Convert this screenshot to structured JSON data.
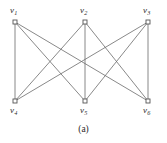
{
  "figure": {
    "caption": "(a)",
    "background_color": "#ffffff",
    "edge_color": "#6b6b6b",
    "vertex_stroke_color": "#555555",
    "vertex_fill_color": "#ffffff",
    "label_color": "#2b2b2b"
  },
  "chart_data": {
    "type": "diagram",
    "diagram_type": "graph",
    "title": "(a)",
    "graph_name": "K3,3 complete bipartite graph",
    "vertices": [
      {
        "id": "v1",
        "label": "v",
        "subscript": "1",
        "x": 15,
        "y": 22,
        "part": "top",
        "label_x": 10,
        "label_y": 6
      },
      {
        "id": "v2",
        "label": "v",
        "subscript": "2",
        "x": 85,
        "y": 22,
        "part": "top",
        "label_x": 80,
        "label_y": 6
      },
      {
        "id": "v3",
        "label": "v",
        "subscript": "3",
        "x": 148,
        "y": 22,
        "part": "top",
        "label_x": 143,
        "label_y": 6
      },
      {
        "id": "v4",
        "label": "v",
        "subscript": "4",
        "x": 15,
        "y": 101,
        "part": "bottom",
        "label_x": 10,
        "label_y": 106
      },
      {
        "id": "v5",
        "label": "v",
        "subscript": "5",
        "x": 85,
        "y": 101,
        "part": "bottom",
        "label_x": 80,
        "label_y": 106
      },
      {
        "id": "v6",
        "label": "v",
        "subscript": "6",
        "x": 148,
        "y": 101,
        "part": "bottom",
        "label_x": 143,
        "label_y": 106
      }
    ],
    "edges": [
      {
        "from": "v1",
        "to": "v4"
      },
      {
        "from": "v1",
        "to": "v5"
      },
      {
        "from": "v1",
        "to": "v6"
      },
      {
        "from": "v2",
        "to": "v4"
      },
      {
        "from": "v2",
        "to": "v5"
      },
      {
        "from": "v2",
        "to": "v6"
      },
      {
        "from": "v3",
        "to": "v4"
      },
      {
        "from": "v3",
        "to": "v5"
      },
      {
        "from": "v3",
        "to": "v6"
      }
    ],
    "vertex_count": 6,
    "edge_count": 9,
    "vertex_marker": "open-square",
    "vertex_marker_size": 4
  }
}
